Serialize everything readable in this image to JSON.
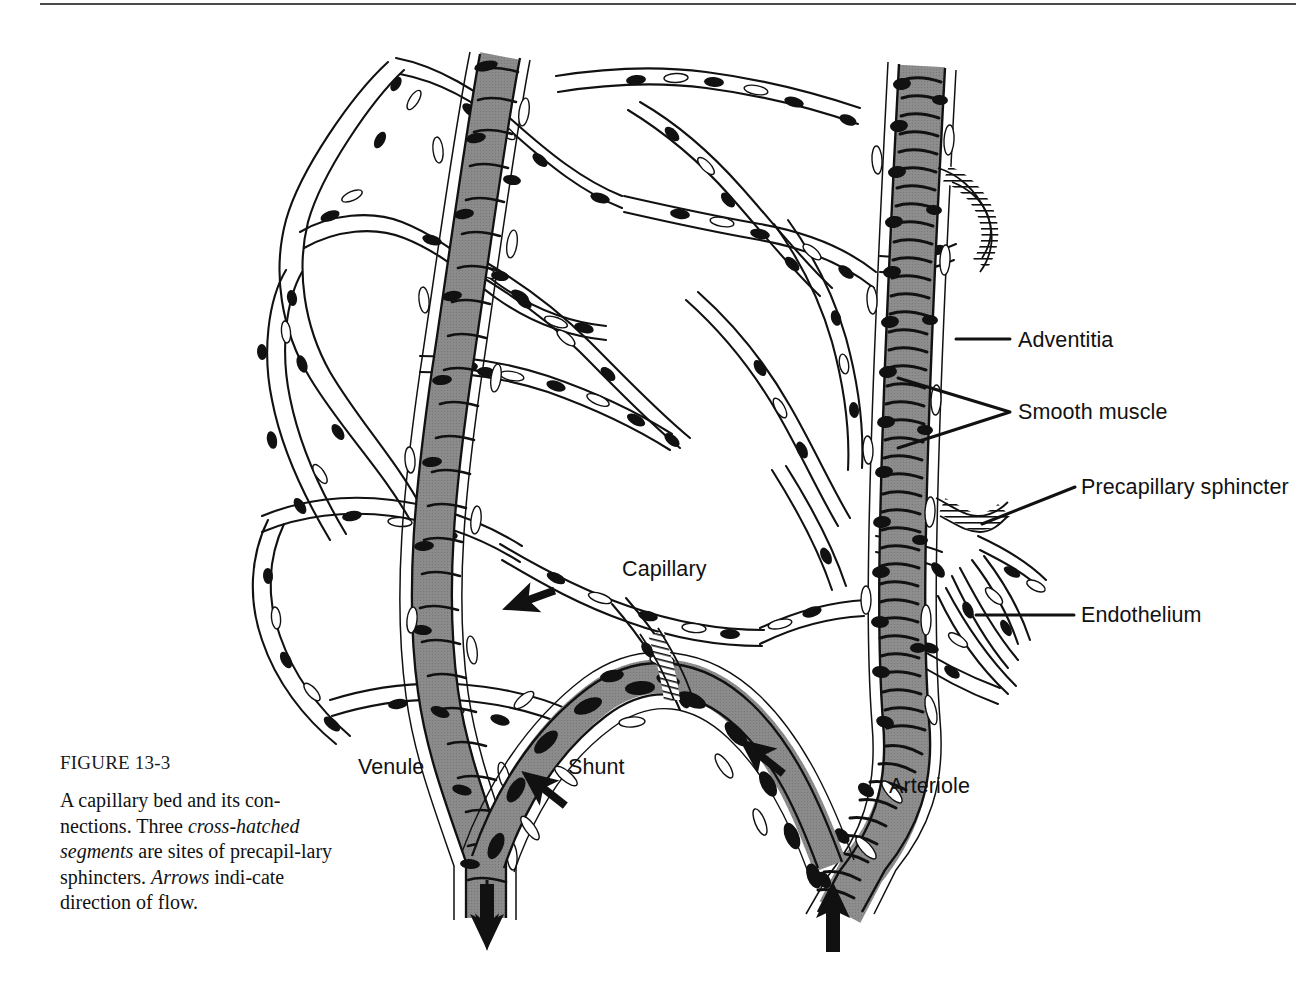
{
  "figure": {
    "number_label": "FIGURE 13-3",
    "caption_parts": [
      {
        "text": "A capillary bed and its con-nections. Three ",
        "style": "normal"
      },
      {
        "text": "cross-hatched segments",
        "style": "italic"
      },
      {
        "text": " are sites of precapil-lary sphincters. ",
        "style": "normal"
      },
      {
        "text": "Arrows",
        "style": "italic"
      },
      {
        "text": " indi-cate direction of flow.",
        "style": "normal"
      }
    ],
    "caption_text": "A capillary bed and its connections. Three cross-hatched segments are sites of precapillary sphincters. Arrows indicate direction of flow.",
    "caption_lines": [
      "A capillary bed and its con-",
      "nections. Three cross-hatched",
      "segments are sites of precapil-",
      "lary sphincters. Arrows indi-",
      "cate direction of flow."
    ]
  },
  "labels": {
    "adventitia": "Adventitia",
    "smooth_muscle": "Smooth muscle",
    "precapillary_sphincter": "Precapillary sphincter",
    "endothelium": "Endothelium",
    "capillary": "Capillary",
    "venule": "Venule",
    "shunt": "Shunt",
    "arteriole": "Arteriole"
  },
  "diagram": {
    "type": "anatomical-line-drawing",
    "colors": {
      "ink": "#111111",
      "vessel_lumen_gray": "#9a9a9a",
      "vessel_lumen_gray_light": "#b5b5b5",
      "background": "#ffffff",
      "rule": "#4a4a4a"
    },
    "structures": [
      {
        "name": "venule",
        "kind": "gray-vessel",
        "position": "left, runs top-center to bottom-left",
        "shading": "gray lumen with dark transverse striations"
      },
      {
        "name": "arteriole",
        "kind": "gray-vessel",
        "position": "right, vertical",
        "shading": "gray lumen with dense dark smooth-muscle striations"
      },
      {
        "name": "shunt",
        "kind": "gray-vessel",
        "position": "bottom center arch",
        "shading": "gray lumen with large black nuclei"
      },
      {
        "name": "capillary-network",
        "kind": "thin-white-tubes",
        "position": "center",
        "shading": "white lumen, paired outlines, dark elongated endothelial nuclei"
      },
      {
        "name": "precapillary-sphincter-1",
        "kind": "cross-hatched-segment",
        "position": "upper right, off arteriole"
      },
      {
        "name": "precapillary-sphincter-2",
        "kind": "cross-hatched-segment",
        "position": "mid right, off arteriole"
      },
      {
        "name": "precapillary-sphincter-3",
        "kind": "cross-hatched-segment",
        "position": "lower center, off shunt"
      }
    ],
    "flow_arrows": [
      {
        "id": "arrow-venule-out",
        "direction": "down",
        "location": "bottom of venule"
      },
      {
        "id": "arrow-arteriole-in",
        "direction": "up",
        "location": "bottom of arteriole"
      },
      {
        "id": "arrow-shunt-left",
        "direction": "down-left",
        "location": "left limb of shunt"
      },
      {
        "id": "arrow-shunt-right",
        "direction": "up-left",
        "location": "right limb of shunt"
      },
      {
        "id": "arrow-capillary",
        "direction": "up-left",
        "location": "mid-left capillary toward venule"
      }
    ],
    "leader_lines": [
      {
        "label": "adventitia",
        "style": "straight horizontal",
        "points_to": "arteriole outer coat"
      },
      {
        "label": "smooth_muscle",
        "style": "two-pronged fork",
        "points_to": "two sites on arteriole wall"
      },
      {
        "label": "precapillary_sphincter",
        "style": "diagonal",
        "points_to": "cross-hatched segment"
      },
      {
        "label": "endothelium",
        "style": "straight horizontal",
        "points_to": "capillary wall"
      }
    ]
  }
}
